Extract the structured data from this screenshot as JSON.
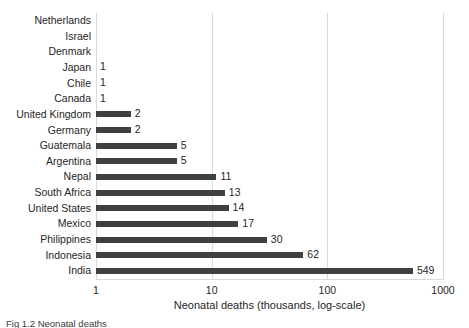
{
  "chart_data": {
    "type": "bar",
    "orientation": "horizontal",
    "title": "",
    "xlabel": "Neonatal deaths (thousands, log-scale)",
    "ylabel": "",
    "xscale": "log",
    "xlim": [
      1,
      1000
    ],
    "xticks": [
      "1",
      "10",
      "100",
      "1000"
    ],
    "xtick_values": [
      1,
      10,
      100,
      1000
    ],
    "grid": "vertical",
    "legend": "none",
    "bar_color": "#404040",
    "gridline_color": "#d9d9d9",
    "categories": [
      "Netherlands",
      "Israel",
      "Denmark",
      "Japan",
      "Chile",
      "Canada",
      "United Kingdom",
      "Germany",
      "Guatemala",
      "Argentina",
      "Nepal",
      "South Africa",
      "United States",
      "Mexico",
      "Philippines",
      "Indonesia",
      "India"
    ],
    "values": [
      null,
      null,
      null,
      1,
      1,
      1,
      2,
      2,
      5,
      5,
      11,
      13,
      14,
      17,
      30,
      62,
      549
    ],
    "data_labels": [
      "",
      "",
      "",
      "1",
      "1",
      "1",
      "2",
      "2",
      "5",
      "5",
      "11",
      "13",
      "14",
      "17",
      "30",
      "62",
      "549"
    ]
  },
  "caption": {
    "text": "Fig 1.2  Neonatal deaths"
  }
}
